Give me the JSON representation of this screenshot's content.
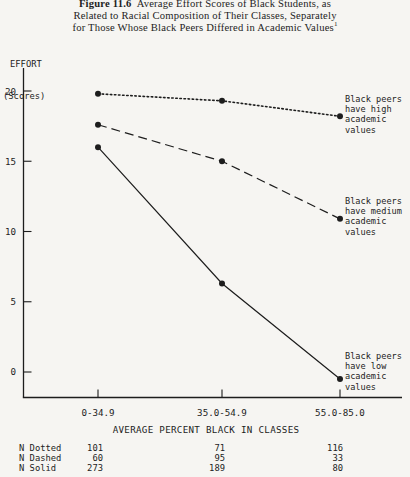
{
  "page": {
    "background": "#f6f5f2",
    "ink": "#1d1d1d"
  },
  "title": {
    "figure_label": "Figure 11.6",
    "line1_rest": "  Average Effort Scores of Black Students, as",
    "line2": "Related to Racial Composition of Their Classes, Separately",
    "line3": "for Those Whose Black Peers Differed in Academic Values",
    "footnote_marker": "1"
  },
  "y_axis": {
    "label_line1": "EFFORT",
    "label_line2": "(Scores)"
  },
  "chart_data": {
    "type": "line",
    "categories": [
      "0-34.9",
      "35.0-54.9",
      "55.0-85.0"
    ],
    "series": [
      {
        "name": "Black peers have high academic values",
        "style": "dotted",
        "values": [
          19.8,
          19.3,
          18.2
        ]
      },
      {
        "name": "Black peers have medium academic values",
        "style": "dashed",
        "values": [
          17.6,
          15.0,
          10.9
        ]
      },
      {
        "name": "Black peers have low academic values",
        "style": "solid",
        "values": [
          16.0,
          6.3,
          -0.5
        ]
      }
    ],
    "yticks": [
      0,
      5,
      10,
      15,
      20
    ],
    "ylim": [
      -2,
      22
    ],
    "xlabel": "AVERAGE PERCENT BLACK IN CLASSES",
    "ylabel": "EFFORT (Scores)",
    "grid": false,
    "legend_position": "right-annotations",
    "marker": "filled-circle"
  },
  "annotations": [
    {
      "text": "Black peers\nhave high\nacademic\nvalues"
    },
    {
      "text": "Black peers\nhave medium\nacademic\nvalues"
    },
    {
      "text": "Black peers\nhave low\nacademic\nvalues"
    }
  ],
  "sample_table": {
    "rows": [
      {
        "label": "N Dotted",
        "values": [
          "101",
          "71",
          "116"
        ]
      },
      {
        "label": "N Dashed",
        "values": [
          "60",
          "95",
          "33"
        ]
      },
      {
        "label": "N Solid",
        "values": [
          "273",
          "189",
          "80"
        ]
      }
    ]
  }
}
